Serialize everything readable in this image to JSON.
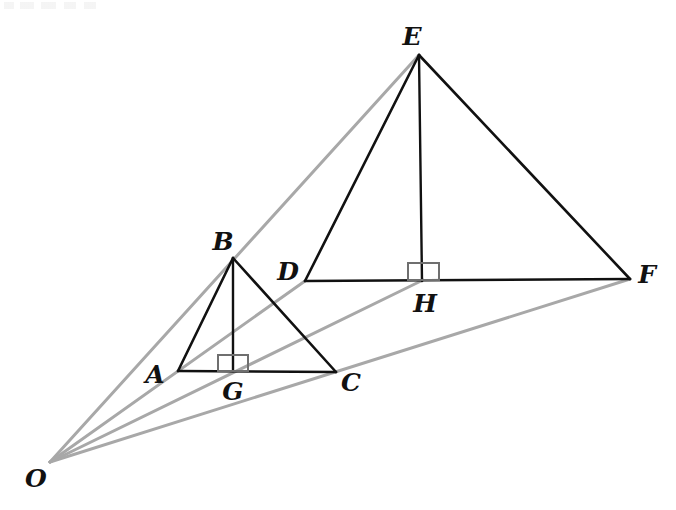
{
  "figure": {
    "type": "geometry-diagram",
    "width": 676,
    "height": 510,
    "background_color": "#ffffff",
    "stroke_colors": {
      "triangle_edges": "#111111",
      "altitude": "#111111",
      "projection_rays": "#a8a8a8",
      "right_angle_marker": "#6f6f6f",
      "label_text": "#111111"
    },
    "stroke_widths": {
      "triangle_edges": 2.6,
      "altitude": 2.4,
      "projection_rays": 3.0,
      "right_angle_marker": 2.0
    }
  },
  "points": {
    "O": {
      "label": "O",
      "x": 50,
      "y": 462,
      "label_x": 36,
      "label_y": 478
    },
    "A": {
      "label": "A",
      "x": 178,
      "y": 371,
      "label_x": 155,
      "label_y": 374
    },
    "B": {
      "label": "B",
      "x": 233,
      "y": 258,
      "label_x": 223,
      "label_y": 241
    },
    "C": {
      "label": "C",
      "x": 336,
      "y": 372,
      "label_x": 351,
      "label_y": 382
    },
    "G": {
      "label": "G",
      "x": 233,
      "y": 371,
      "label_x": 233,
      "label_y": 391
    },
    "D": {
      "label": "D",
      "x": 305,
      "y": 281,
      "label_x": 288,
      "label_y": 271
    },
    "E": {
      "label": "E",
      "x": 419,
      "y": 55,
      "label_x": 412,
      "label_y": 36
    },
    "F": {
      "label": "F",
      "x": 630,
      "y": 279,
      "label_x": 647,
      "label_y": 274
    },
    "H": {
      "label": "H",
      "x": 423,
      "y": 280,
      "label_x": 425,
      "label_y": 303
    }
  },
  "small_triangle": {
    "name": "triangle-ABC",
    "vertices": [
      "A",
      "B",
      "C"
    ],
    "edges": [
      {
        "name": "segment-AB",
        "from": "A",
        "to": "B"
      },
      {
        "name": "segment-BC",
        "from": "B",
        "to": "C"
      },
      {
        "name": "segment-AC",
        "from": "A",
        "to": "C"
      }
    ],
    "altitude": {
      "name": "altitude-BG",
      "from": "B",
      "to": "G"
    },
    "right_angle": {
      "name": "right-angle-marker-G",
      "x": 218,
      "y": 355,
      "width": 30,
      "height": 16
    }
  },
  "large_triangle": {
    "name": "triangle-DEF",
    "vertices": [
      "D",
      "E",
      "F"
    ],
    "edges": [
      {
        "name": "segment-DE",
        "from": "D",
        "to": "E"
      },
      {
        "name": "segment-EF",
        "from": "E",
        "to": "F"
      },
      {
        "name": "segment-DF",
        "from": "D",
        "to": "F"
      }
    ],
    "altitude": {
      "name": "altitude-EH",
      "from": "E",
      "to": "H"
    },
    "right_angle": {
      "name": "right-angle-marker-H",
      "x": 408,
      "y": 263,
      "width": 31,
      "height": 17
    }
  },
  "projection_rays": [
    {
      "name": "ray-O-B-E",
      "from": "O",
      "through": "B",
      "to": "E"
    },
    {
      "name": "ray-O-A-D",
      "from": "O",
      "through": "A",
      "to": "D"
    },
    {
      "name": "ray-O-G-H",
      "from": "O",
      "through": "G",
      "to": "H"
    },
    {
      "name": "ray-O-C-F",
      "from": "O",
      "through": "C",
      "to": "F"
    }
  ],
  "labels": [
    "O",
    "A",
    "B",
    "C",
    "G",
    "D",
    "E",
    "F",
    "H"
  ]
}
